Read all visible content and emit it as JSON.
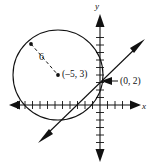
{
  "figure": {
    "background_color": "#ffffff",
    "stroke_color": "#111111",
    "width": 156,
    "height": 167
  },
  "axes": {
    "x_label": "x",
    "y_label": "y",
    "origin": {
      "x": 100,
      "y": 105
    },
    "unit_px": 7.5,
    "x_axis": {
      "start_x": 10,
      "end_x": 140,
      "y": 105,
      "tick_count_left": 11,
      "tick_count_right": 4,
      "tick_half_len": 4,
      "arrow_left": true,
      "arrow_right": true
    },
    "y_axis": {
      "x": 100,
      "start_y": 16,
      "end_y": 160,
      "tick_count_up": 10,
      "tick_count_down": 6,
      "tick_half_len": 4,
      "arrow_up": true,
      "arrow_down": true
    }
  },
  "circle": {
    "center_px": {
      "x": 58,
      "y": 75
    },
    "radius_px": 45,
    "center_coords": "(–5, 3)",
    "center_label": "(–5, 3)",
    "radius_label": "6",
    "center_dot": true,
    "edge_dot_px": {
      "x": 31,
      "y": 44
    },
    "radius_line_dashed": true
  },
  "line": {
    "start_px": {
      "x": 40,
      "y": 141
    },
    "end_px": {
      "x": 143,
      "y": 41
    },
    "arrow_start": true,
    "arrow_end": true,
    "y_intercept_label": "(0, 2)",
    "y_intercept_px": {
      "x": 100,
      "y": 81
    }
  },
  "annotations": {
    "intercept_arrow": {
      "from_px": {
        "x": 118,
        "y": 81
      },
      "to_px": {
        "x": 102,
        "y": 81
      }
    }
  }
}
